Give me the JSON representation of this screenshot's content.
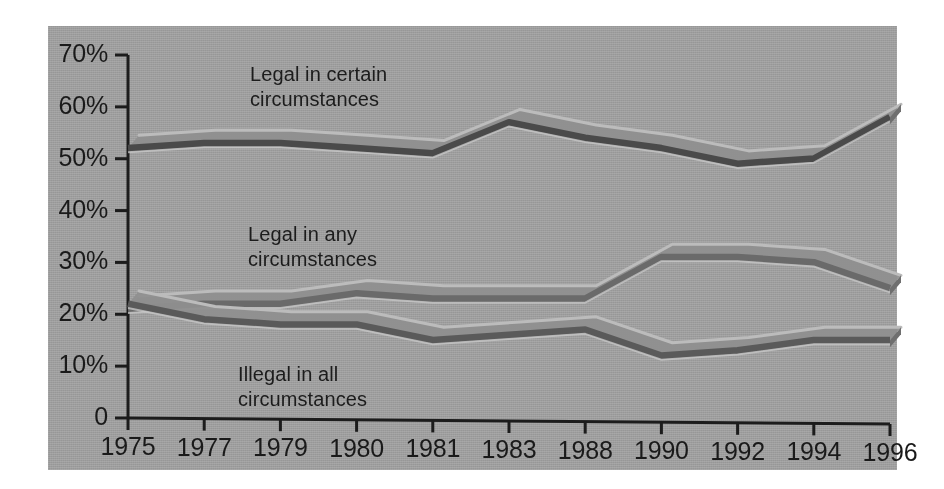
{
  "panel": {
    "background_color": "#9d9d9d",
    "page_background_color": "#ffffff"
  },
  "chart_data": {
    "type": "line",
    "title": "",
    "subtitle": "",
    "xlabel": "",
    "ylabel": "",
    "grid": false,
    "legend_position": "inline-annotations",
    "categories": [
      "1975",
      "1977",
      "1979",
      "1980",
      "1981",
      "1983",
      "1988",
      "1990",
      "1992",
      "1994",
      "1996"
    ],
    "xtick_labels": [
      "1975",
      "1977",
      "1979",
      "1980",
      "1981",
      "1983",
      "1988",
      "1990",
      "1992",
      "1994",
      "1996"
    ],
    "ytick_labels": [
      "70%",
      "60%",
      "50%",
      "40%",
      "30%",
      "20%",
      "10%",
      "0"
    ],
    "ytick_values": [
      70,
      60,
      50,
      40,
      30,
      20,
      10,
      0
    ],
    "ylim": [
      0,
      70
    ],
    "yunit": "%",
    "series": [
      {
        "name": "Legal in certain circumstances",
        "label_text": "Legal in certain\ncircumstances",
        "color": "#4a4a4a",
        "values": [
          52,
          53,
          53,
          52,
          51,
          57,
          54,
          52,
          49,
          50,
          58
        ]
      },
      {
        "name": "Legal in any circumstances",
        "label_text": "Legal in any\ncircumstances",
        "color": "#6a6a6a",
        "values": [
          21,
          22,
          22,
          24,
          23,
          23,
          23,
          31,
          31,
          30,
          25
        ]
      },
      {
        "name": "Illegal in all circumstances",
        "label_text": "Illegal in all\ncircumstances",
        "color": "#5a5a5a",
        "values": [
          22,
          19,
          18,
          18,
          15,
          16,
          17,
          12,
          13,
          15,
          15
        ]
      }
    ],
    "annotations": [
      {
        "text": "Legal in certain circumstances",
        "x_category": "1979",
        "y_value": 63
      },
      {
        "text": "Legal in any circumstances",
        "x_category": "1979",
        "y_value": 32
      },
      {
        "text": "Illegal in all circumstances",
        "x_category": "1979",
        "y_value": 12
      }
    ]
  }
}
